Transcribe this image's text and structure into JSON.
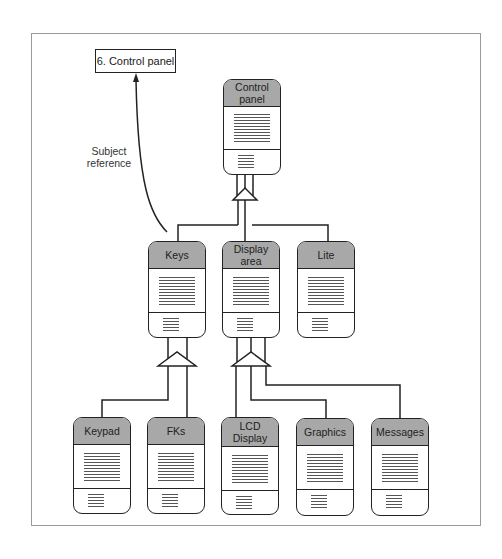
{
  "reference": {
    "label": "6. Control panel",
    "arrow_label_line1": "Subject",
    "arrow_label_line2": "reference"
  },
  "classes": {
    "control_panel": {
      "name": "Control panel"
    },
    "keys": {
      "name": "Keys"
    },
    "display_area": {
      "name": "Display area"
    },
    "lite": {
      "name": "Lite"
    },
    "keypad": {
      "name": "Keypad"
    },
    "fks": {
      "name": "FKs"
    },
    "lcd_display": {
      "name": "LCD Display"
    },
    "graphics": {
      "name": "Graphics"
    },
    "messages": {
      "name": "Messages"
    }
  },
  "relationships": [
    {
      "type": "whole-part",
      "whole": "Control panel",
      "parts": [
        "Keys",
        "Display area",
        "Lite"
      ]
    },
    {
      "type": "whole-part",
      "whole": "Keys",
      "parts": [
        "Keypad",
        "FKs"
      ]
    },
    {
      "type": "whole-part",
      "whole": "Display area",
      "parts": [
        "LCD Display",
        "Graphics",
        "Messages"
      ]
    },
    {
      "type": "subject-reference",
      "from": "Keys",
      "to": "6. Control panel"
    }
  ],
  "colors": {
    "header_fill": "#a8a8a8",
    "stroke": "#222222",
    "frame": "#9a9a9a"
  }
}
